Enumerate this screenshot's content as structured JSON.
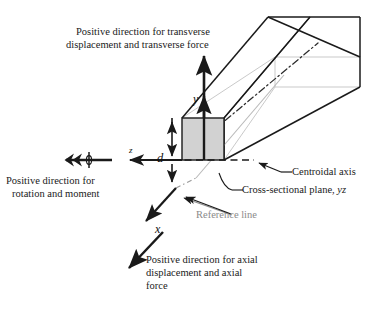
{
  "figure": {
    "colors": {
      "line": "#1a1a1a",
      "hidden_line": "#c3c3c3",
      "section_fill": "#d2d2d2",
      "reference_gray": "#8a8a8a",
      "background": "#ffffff"
    }
  },
  "annotations": {
    "transverse": {
      "line1": "Positive direction for transverse",
      "line2": "displacement and transverse force"
    },
    "rotation": {
      "line1": "Positive direction for",
      "line2": "rotation and moment"
    },
    "axial": {
      "line1": "Positive direction for axial",
      "line2": "displacement and axial",
      "line3": "force"
    },
    "centroidal_axis": "Centroidal axis",
    "cross_section_plane": "Cross-sectional plane, ",
    "cross_section_plane_italic": "yz",
    "reference_line": "Reference line"
  },
  "axes": {
    "y_label": "y",
    "x_label": "x",
    "z_label": "z"
  },
  "dimensions": {
    "depth_label": "d"
  }
}
